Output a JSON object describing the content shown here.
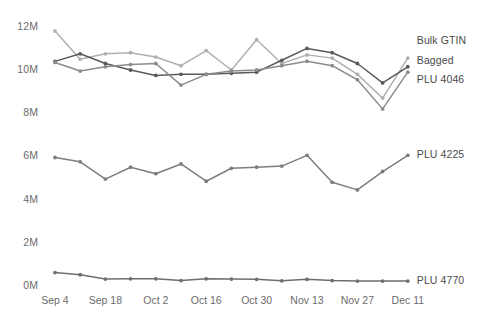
{
  "chart_data": {
    "type": "line",
    "title": "",
    "xlabel": "",
    "ylabel": "",
    "ylim": [
      0,
      12000000
    ],
    "ytick_labels": [
      "0M",
      "2M",
      "4M",
      "6M",
      "8M",
      "10M",
      "12M"
    ],
    "ytick_values": [
      0,
      2000000,
      4000000,
      6000000,
      8000000,
      10000000,
      12000000
    ],
    "xtick_labels": [
      "Sep 4",
      "Sep 18",
      "Oct 2",
      "Oct 16",
      "Oct 30",
      "Nov 13",
      "Nov 27",
      "Dec 11"
    ],
    "x": [
      0,
      1,
      2,
      3,
      4,
      5,
      6,
      7,
      8,
      9,
      10,
      11,
      12,
      13,
      14
    ],
    "grid": false,
    "legend_position": "right",
    "series": [
      {
        "name": "Bulk GTIN",
        "color": "#b0b0b0",
        "values": [
          11800000,
          10500000,
          10750000,
          10800000,
          10600000,
          10200000,
          10900000,
          10000000,
          11400000,
          10300000,
          10700000,
          10550000,
          9800000,
          8700000,
          10550000
        ]
      },
      {
        "name": "Bagged",
        "color": "#5a5a5a",
        "values": [
          10400000,
          10750000,
          10300000,
          10000000,
          9750000,
          9800000,
          9800000,
          9850000,
          9900000,
          10450000,
          11000000,
          10800000,
          10300000,
          9400000,
          10150000
        ]
      },
      {
        "name": "PLU 4046",
        "color": "#8c8c8c",
        "values": [
          10350000,
          9950000,
          10150000,
          10250000,
          10300000,
          9300000,
          9800000,
          9950000,
          10000000,
          10200000,
          10400000,
          10200000,
          9550000,
          8200000,
          9900000
        ]
      },
      {
        "name": "PLU 4225",
        "color": "#7d7d7d",
        "values": [
          5950000,
          5750000,
          4950000,
          5500000,
          5200000,
          5650000,
          4850000,
          5450000,
          5500000,
          5550000,
          6050000,
          4800000,
          4450000,
          5300000,
          6050000
        ]
      },
      {
        "name": "PLU 4770",
        "color": "#6e6e6e",
        "values": [
          620000,
          520000,
          320000,
          330000,
          330000,
          250000,
          330000,
          320000,
          310000,
          240000,
          310000,
          250000,
          230000,
          230000,
          230000
        ]
      }
    ]
  },
  "axis": {
    "y_min": 0,
    "y_max": 12000000,
    "x_count": 15
  }
}
